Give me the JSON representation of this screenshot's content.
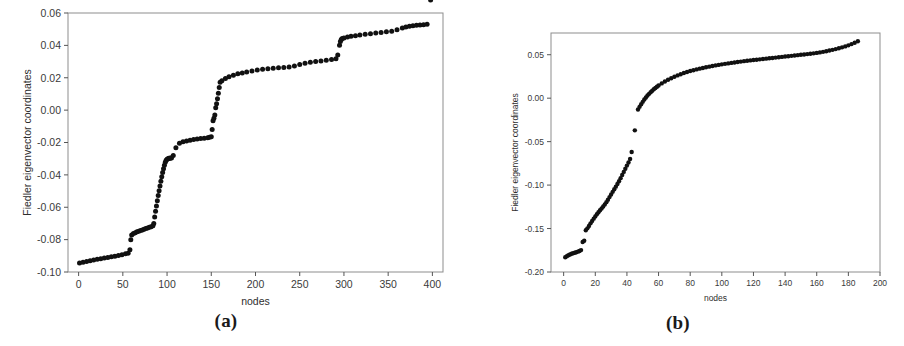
{
  "figure": {
    "panels": [
      {
        "id": "panel-a",
        "caption": "(a)",
        "xlabel": "nodes",
        "ylabel": "Fiedler eigenvector coordinates"
      },
      {
        "id": "panel-b",
        "caption": "(b)",
        "xlabel": "nodes",
        "ylabel": "Fiedler eigenvector coordinates"
      }
    ]
  },
  "chart_data": [
    {
      "type": "scatter",
      "panel": "(a)",
      "title": "",
      "xlabel": "nodes",
      "ylabel": "Fiedler eigenvector coordinates",
      "xlim": [
        -12,
        412
      ],
      "ylim": [
        -0.1,
        0.06
      ],
      "xticks": [
        0,
        50,
        100,
        150,
        200,
        250,
        300,
        350,
        400
      ],
      "xticklabels": [
        "0",
        "50",
        "100",
        "150",
        "200",
        "250",
        "300",
        "350",
        "400"
      ],
      "yticks": [
        -0.1,
        -0.08,
        -0.06,
        -0.04,
        -0.02,
        0.0,
        0.02,
        0.04,
        0.06
      ],
      "yticklabels": [
        "-0.10",
        "-0.08",
        "-0.06",
        "-0.04",
        "-0.02",
        "0.00",
        "0.02",
        "0.04",
        "0.06"
      ],
      "grid": false,
      "legend": null,
      "marker": "filled-circle",
      "marker_color": "#111111",
      "description": "Sorted Fiedler vector entries for a 400-node graph; staircase of plateaus indicates clustered community structure.",
      "x": [
        1,
        5,
        9,
        13,
        17,
        21,
        25,
        29,
        33,
        37,
        41,
        45,
        49,
        53,
        56,
        58,
        59,
        60,
        62,
        64,
        66,
        68,
        70,
        72,
        74,
        76,
        78,
        80,
        82,
        84,
        85,
        86,
        87,
        88,
        89,
        90,
        91,
        92,
        93,
        94,
        95,
        96,
        97,
        98,
        99,
        100,
        101,
        102,
        103,
        104,
        105,
        107,
        110,
        114,
        118,
        122,
        126,
        130,
        134,
        138,
        142,
        146,
        148,
        150,
        151,
        152,
        153,
        154,
        155,
        156,
        157,
        158,
        159,
        160,
        162,
        166,
        170,
        175,
        180,
        185,
        190,
        196,
        202,
        208,
        214,
        220,
        226,
        232,
        238,
        244,
        250,
        256,
        262,
        268,
        274,
        280,
        286,
        291,
        293,
        295,
        296,
        297,
        298,
        300,
        304,
        308,
        313,
        318,
        324,
        330,
        336,
        342,
        348,
        354,
        360,
        366,
        370,
        374,
        378,
        382,
        386,
        390,
        394,
        398
      ],
      "y": [
        -0.0945,
        -0.094,
        -0.0935,
        -0.093,
        -0.0926,
        -0.0922,
        -0.0918,
        -0.0914,
        -0.091,
        -0.0906,
        -0.0902,
        -0.0898,
        -0.0893,
        -0.0888,
        -0.0884,
        -0.0862,
        -0.08,
        -0.0772,
        -0.0762,
        -0.0757,
        -0.0752,
        -0.0748,
        -0.0744,
        -0.074,
        -0.0736,
        -0.0732,
        -0.0728,
        -0.0724,
        -0.072,
        -0.0714,
        -0.07,
        -0.066,
        -0.0625,
        -0.0592,
        -0.056,
        -0.0528,
        -0.0498,
        -0.0468,
        -0.044,
        -0.0412,
        -0.0386,
        -0.0362,
        -0.034,
        -0.0322,
        -0.031,
        -0.0303,
        -0.03,
        -0.0298,
        -0.0297,
        -0.0296,
        -0.0295,
        -0.028,
        -0.0232,
        -0.0205,
        -0.0196,
        -0.019,
        -0.0186,
        -0.0182,
        -0.0179,
        -0.0176,
        -0.0173,
        -0.017,
        -0.0168,
        -0.0165,
        -0.012,
        -0.0065,
        -0.005,
        -0.003,
        0.0015,
        0.004,
        0.007,
        0.0105,
        0.014,
        0.0172,
        0.0182,
        0.0196,
        0.0206,
        0.0216,
        0.0224,
        0.023,
        0.0236,
        0.0242,
        0.0248,
        0.0252,
        0.0256,
        0.0259,
        0.0262,
        0.0264,
        0.0266,
        0.0272,
        0.0282,
        0.029,
        0.0296,
        0.03,
        0.0304,
        0.0308,
        0.0312,
        0.0318,
        0.034,
        0.04,
        0.0424,
        0.0436,
        0.0442,
        0.0446,
        0.0452,
        0.0456,
        0.046,
        0.0464,
        0.0468,
        0.0472,
        0.0476,
        0.048,
        0.0484,
        0.0488,
        0.0496,
        0.0508,
        0.0514,
        0.0518,
        0.0521,
        0.0524,
        0.0526,
        0.0528,
        0.053
      ]
    },
    {
      "type": "scatter",
      "panel": "(b)",
      "title": "",
      "xlabel": "nodes",
      "ylabel": "Fiedler eigenvector coordinates",
      "xlim": [
        -8,
        200
      ],
      "ylim": [
        -0.2,
        0.075
      ],
      "xticks": [
        0,
        20,
        40,
        60,
        80,
        100,
        120,
        140,
        160,
        180,
        200
      ],
      "xticklabels": [
        "0",
        "20",
        "40",
        "60",
        "80",
        "100",
        "120",
        "140",
        "160",
        "180",
        "200"
      ],
      "yticks": [
        -0.2,
        -0.15,
        -0.1,
        -0.05,
        0.0,
        0.05
      ],
      "yticklabels": [
        "-0.20",
        "-0.15",
        "-0.10",
        "-0.05",
        "0.00",
        "0.05"
      ],
      "grid": false,
      "legend": null,
      "marker": "filled-circle",
      "marker_color": "#111111",
      "description": "Sorted Fiedler vector entries for a ~186-node graph; a single isolated point near node 45 separates the negative branch from the positive branch.",
      "x": [
        1,
        2,
        3,
        4,
        5,
        6,
        7,
        8,
        9,
        10,
        11,
        12,
        13,
        14,
        15,
        16,
        17,
        18,
        19,
        20,
        21,
        22,
        23,
        24,
        25,
        26,
        27,
        28,
        29,
        30,
        31,
        32,
        33,
        34,
        35,
        36,
        37,
        38,
        39,
        40,
        41,
        42,
        43,
        45,
        47,
        48,
        49,
        50,
        51,
        52,
        53,
        54,
        55,
        56,
        57,
        58,
        59,
        60,
        62,
        64,
        66,
        68,
        70,
        72,
        74,
        76,
        78,
        80,
        82,
        84,
        86,
        88,
        90,
        92,
        94,
        96,
        98,
        100,
        102,
        104,
        106,
        108,
        110,
        112,
        114,
        116,
        118,
        120,
        122,
        124,
        126,
        128,
        130,
        132,
        134,
        136,
        138,
        140,
        142,
        144,
        146,
        148,
        150,
        152,
        154,
        156,
        158,
        160,
        162,
        164,
        166,
        168,
        170,
        172,
        174,
        176,
        178,
        180,
        182,
        184,
        186
      ],
      "y": [
        -0.183,
        -0.1818,
        -0.1808,
        -0.1798,
        -0.179,
        -0.1784,
        -0.1778,
        -0.1772,
        -0.1766,
        -0.1758,
        -0.1748,
        -0.1655,
        -0.164,
        -0.152,
        -0.1498,
        -0.147,
        -0.144,
        -0.1412,
        -0.1386,
        -0.136,
        -0.1336,
        -0.1312,
        -0.129,
        -0.1268,
        -0.1246,
        -0.1222,
        -0.1196,
        -0.1168,
        -0.1138,
        -0.1108,
        -0.1078,
        -0.1048,
        -0.1018,
        -0.0988,
        -0.0956,
        -0.092,
        -0.0884,
        -0.0848,
        -0.0812,
        -0.0776,
        -0.074,
        -0.07,
        -0.062,
        -0.037,
        -0.013,
        -0.01,
        -0.007,
        -0.0042,
        -0.0016,
        0.0008,
        0.003,
        0.005,
        0.0068,
        0.0086,
        0.0102,
        0.0118,
        0.0132,
        0.0146,
        0.017,
        0.0192,
        0.0212,
        0.023,
        0.0247,
        0.0262,
        0.0276,
        0.0289,
        0.0301,
        0.0312,
        0.0322,
        0.0331,
        0.034,
        0.0348,
        0.0356,
        0.0363,
        0.037,
        0.0377,
        0.0383,
        0.0389,
        0.0395,
        0.04,
        0.0406,
        0.0411,
        0.0416,
        0.0421,
        0.0426,
        0.043,
        0.0435,
        0.0439,
        0.0443,
        0.0447,
        0.0451,
        0.0455,
        0.0459,
        0.0463,
        0.0467,
        0.0471,
        0.0475,
        0.0479,
        0.0483,
        0.0487,
        0.0491,
        0.0495,
        0.0499,
        0.0503,
        0.0507,
        0.0511,
        0.0516,
        0.0521,
        0.0527,
        0.0533,
        0.054,
        0.0548,
        0.0556,
        0.0565,
        0.0575,
        0.0585,
        0.0596,
        0.0608,
        0.0622,
        0.0638,
        0.0655,
        0.0668
      ]
    }
  ]
}
